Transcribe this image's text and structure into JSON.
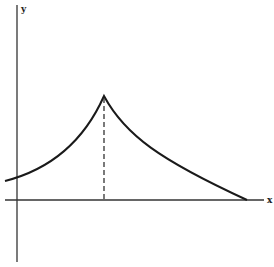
{
  "diagram": {
    "axes": {
      "x_label": "x",
      "y_label": "y"
    },
    "curve": {
      "description": "cusp-shaped curve rising from left, peaking at a cusp, then decaying to meet the x-axis",
      "color": "#1a1a1a"
    },
    "dashed_line": {
      "description": "vertical dashed line from cusp peak down to the x-axis"
    }
  }
}
